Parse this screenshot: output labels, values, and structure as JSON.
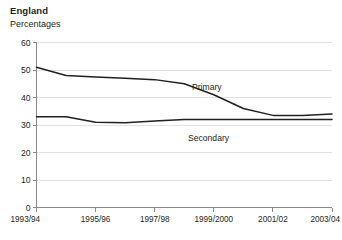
{
  "chart_data": {
    "type": "line",
    "title": "England",
    "subtitle": "Percentages",
    "xlabel": "",
    "ylabel": "Percentages",
    "ylim": [
      0,
      60
    ],
    "yticks": [
      0,
      10,
      20,
      30,
      40,
      50,
      60
    ],
    "grid": true,
    "legend_position": "inline-labels",
    "x": [
      "1993/94",
      "1994/95",
      "1995/96",
      "1996/97",
      "1997/98",
      "1998/99",
      "1999/2000",
      "2000/01",
      "2001/02",
      "2002/03",
      "2003/04"
    ],
    "xtick_labels": [
      "1993/94",
      "1995/96",
      "1997/98",
      "1999/2000",
      "2001/02",
      "2003/04"
    ],
    "xtick_indices": [
      0,
      2,
      4,
      6,
      8,
      10
    ],
    "series": [
      {
        "name": "Primary",
        "values": [
          51,
          48,
          47.5,
          47,
          46.5,
          45,
          41,
          36,
          33.5,
          33.5,
          34
        ]
      },
      {
        "name": "Secondary",
        "values": [
          33,
          33,
          31,
          30.8,
          31.5,
          32,
          32,
          32,
          32,
          32,
          32
        ]
      }
    ]
  },
  "header": {
    "region": "England",
    "units": "Percentages"
  },
  "annotations": {
    "primary_label": "Primary",
    "secondary_label": "Secondary"
  },
  "colors": {
    "line": "#231f20",
    "grid": "#d9d9d9",
    "axis": "#8a8a8a",
    "text": "#231f20",
    "background": "#ffffff"
  }
}
